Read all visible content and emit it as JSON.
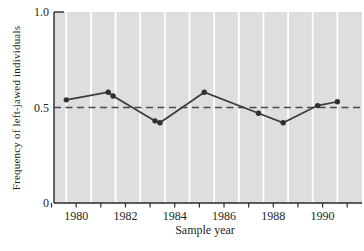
{
  "chart_data": {
    "type": "line",
    "title": "",
    "xlabel": "Sample year",
    "ylabel": "Frequency of left-jawed individuals",
    "xlim": [
      1979.1,
      1991.6
    ],
    "ylim": [
      0,
      1.0
    ],
    "x_ticks": [
      1979,
      1980,
      1981,
      1982,
      1983,
      1984,
      1985,
      1986,
      1987,
      1988,
      1989,
      1990,
      1991
    ],
    "x_tick_labels": [
      "",
      "1980",
      "",
      "1982",
      "",
      "1984",
      "",
      "1986",
      "",
      "1988",
      "",
      "1990",
      ""
    ],
    "y_ticks": [
      {
        "value": 0,
        "label": "0"
      },
      {
        "value": 0.5,
        "label": "0.5"
      },
      {
        "value": 1.0,
        "label": "1.0"
      }
    ],
    "gridlines_x": [
      1979.6,
      1980.6,
      1981.6,
      1982.6,
      1983.6,
      1984.6,
      1985.6,
      1986.6,
      1987.6,
      1988.6,
      1989.6,
      1990.6
    ],
    "grid": "vertical-white-on-gray",
    "legend": "none",
    "reference_line": {
      "y": 0.5,
      "style": "dashed"
    },
    "series": [
      {
        "name": "frequency-of-left-jawed-individuals",
        "points": [
          {
            "x": 1979.6,
            "y": 0.54
          },
          {
            "x": 1981.3,
            "y": 0.58
          },
          {
            "x": 1981.5,
            "y": 0.56
          },
          {
            "x": 1983.2,
            "y": 0.43
          },
          {
            "x": 1983.4,
            "y": 0.42
          },
          {
            "x": 1985.2,
            "y": 0.58
          },
          {
            "x": 1987.4,
            "y": 0.47
          },
          {
            "x": 1988.4,
            "y": 0.42
          },
          {
            "x": 1989.8,
            "y": 0.51
          },
          {
            "x": 1990.6,
            "y": 0.53
          }
        ]
      }
    ]
  },
  "colors": {
    "page_bg": "#ffffff",
    "plot_bg": "#dedede",
    "gridline": "#ffffff",
    "axis": "#2a2a2a",
    "series_line": "#3a3a3a",
    "marker": "#2f2f2f",
    "reference_line": "#4a4a4a",
    "text": "#1f1f1f"
  }
}
